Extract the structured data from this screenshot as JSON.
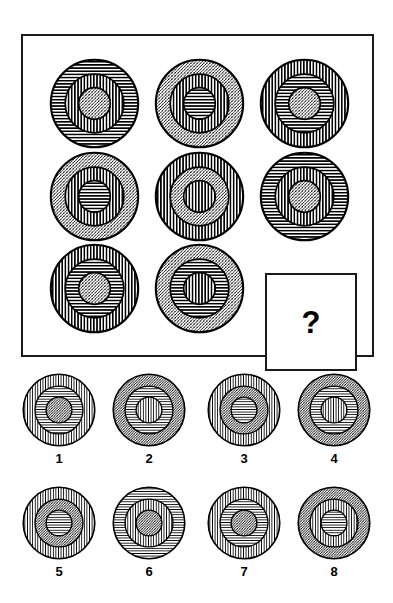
{
  "puzzle": {
    "type": "raven-progressive-matrices",
    "title": "Concentric ring pattern matrix",
    "matrix": {
      "rows": 3,
      "cols": 3,
      "cells": [
        {
          "position": "r1c1",
          "rings": [
            "horizontal",
            "vertical",
            "diagonal"
          ]
        },
        {
          "position": "r1c2",
          "rings": [
            "diagonal",
            "vertical",
            "horizontal"
          ]
        },
        {
          "position": "r1c3",
          "rings": [
            "vertical",
            "horizontal",
            "diagonal"
          ]
        },
        {
          "position": "r2c1",
          "rings": [
            "diagonal",
            "vertical",
            "horizontal"
          ]
        },
        {
          "position": "r2c2",
          "rings": [
            "vertical",
            "diagonal",
            "vertical"
          ]
        },
        {
          "position": "r2c3",
          "rings": [
            "horizontal",
            "vertical",
            "diagonal"
          ]
        },
        {
          "position": "r3c1",
          "rings": [
            "vertical",
            "horizontal",
            "diagonal"
          ]
        },
        {
          "position": "r3c2",
          "rings": [
            "diagonal",
            "horizontal",
            "vertical"
          ]
        },
        {
          "position": "r3c3",
          "rings": null
        }
      ],
      "missing_cell_marker": "?"
    },
    "options": [
      {
        "label": "1",
        "rings": [
          "vertical",
          "horizontal",
          "diagonal"
        ]
      },
      {
        "label": "2",
        "rings": [
          "diagonal",
          "horizontal",
          "vertical"
        ]
      },
      {
        "label": "3",
        "rings": [
          "vertical",
          "diagonal",
          "horizontal"
        ]
      },
      {
        "label": "4",
        "rings": [
          "diagonal",
          "horizontal",
          "vertical"
        ]
      },
      {
        "label": "5",
        "rings": [
          "vertical",
          "diagonal",
          "horizontal"
        ]
      },
      {
        "label": "6",
        "rings": [
          "horizontal",
          "vertical",
          "diagonal"
        ]
      },
      {
        "label": "7",
        "rings": [
          "vertical",
          "horizontal",
          "diagonal"
        ]
      },
      {
        "label": "8",
        "rings": [
          "diagonal",
          "vertical",
          "horizontal"
        ]
      }
    ]
  },
  "colors": {
    "ink": "#1a1a1a",
    "stroke": "#000000",
    "background": "#ffffff"
  }
}
